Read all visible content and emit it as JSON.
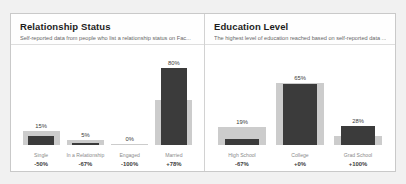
{
  "page": {
    "background_color": "#f1f1f1",
    "card_background": "#ffffff"
  },
  "colors": {
    "total_bar": "#cccccc",
    "value_bar": "#3b3b3b",
    "title_text": "#1d1d1d",
    "subtitle_text": "#676767",
    "axis_name_text": "#8a8a8a",
    "axis_delta_text": "#3d3d3d",
    "border": "#c9c9c9",
    "divider": "#dedede"
  },
  "panels": [
    {
      "id": "relationship-status",
      "title": "Relationship Status",
      "subtitle": "Self-reported data from people who list a relationship status on Fac...",
      "chart_data": {
        "type": "bar",
        "title": "Relationship Status",
        "xlabel": "",
        "ylabel": "",
        "ylim": [
          0,
          100
        ],
        "grid": false,
        "legend": "none",
        "categories": [
          "Single",
          "In a Relationship",
          "Engaged",
          "Married"
        ],
        "value_labels": [
          "15%",
          "5%",
          "0%",
          "80%"
        ],
        "delta_labels": [
          "-50%",
          "-67%",
          "-100%",
          "+78%"
        ],
        "series": [
          {
            "name": "Total",
            "values": [
              15,
              5,
              1,
              47
            ]
          },
          {
            "name": "Reported",
            "values": [
              9,
              2,
              0,
              80
            ]
          }
        ]
      }
    },
    {
      "id": "education-level",
      "title": "Education Level",
      "subtitle": "The highest level of education reached based on self-reported data ...",
      "chart_data": {
        "type": "bar",
        "title": "Education Level",
        "xlabel": "",
        "ylabel": "",
        "ylim": [
          0,
          100
        ],
        "grid": false,
        "legend": "none",
        "categories": [
          "High School",
          "College",
          "Grad School"
        ],
        "value_labels": [
          "19%",
          "65%",
          "28%"
        ],
        "delta_labels": [
          "-67%",
          "+0%",
          "+100%"
        ],
        "series": [
          {
            "name": "Total",
            "values": [
              19,
              65,
              9
            ]
          },
          {
            "name": "Reported",
            "values": [
              6,
              64,
              20
            ]
          }
        ]
      }
    }
  ]
}
